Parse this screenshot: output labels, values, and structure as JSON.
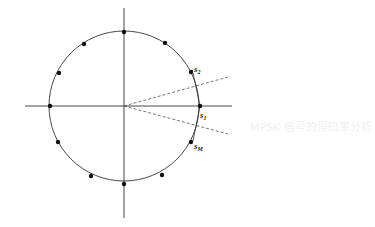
{
  "diagram": {
    "center": [
      124,
      106
    ],
    "radius": 75,
    "axes": {
      "x_range": [
        25,
        232
      ],
      "y_range": [
        8,
        218
      ]
    },
    "points": [
      {
        "x": 124,
        "y": 32
      },
      {
        "x": 165,
        "y": 43
      },
      {
        "x": 191,
        "y": 72,
        "label": "s",
        "sub": "2"
      },
      {
        "x": 200,
        "y": 106,
        "label": "s",
        "sub": "1"
      },
      {
        "x": 191,
        "y": 142,
        "label": "s",
        "sub": "M"
      },
      {
        "x": 162,
        "y": 175
      },
      {
        "x": 124,
        "y": 184
      },
      {
        "x": 91,
        "y": 176
      },
      {
        "x": 58,
        "y": 142
      },
      {
        "x": 50,
        "y": 106
      },
      {
        "x": 59,
        "y": 73
      },
      {
        "x": 84,
        "y": 44
      }
    ],
    "dashed_boundaries": [
      {
        "x2": 228,
        "y2": 77
      },
      {
        "x2": 228,
        "y2": 134
      }
    ],
    "labels": {
      "s2": {
        "main": "s",
        "sub": "2"
      },
      "s1": {
        "main": "s",
        "sub": "1"
      },
      "sM": {
        "main": "s",
        "sub": "M"
      }
    },
    "colors": {
      "line": "#333333",
      "point": "#111111",
      "dash": "#555555"
    }
  },
  "background_text": [
    "MPSK 信号的误码率分析",
    "P = Q(√2E/N₀)"
  ]
}
